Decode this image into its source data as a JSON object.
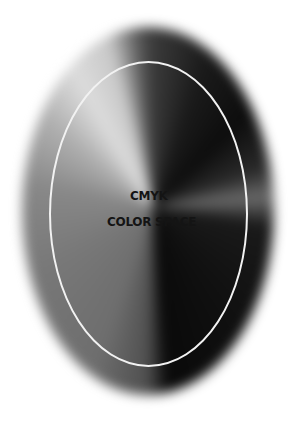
{
  "graphic": {
    "title_line1": "CMYK",
    "title_line2": "COLOR SPACE",
    "ring_color": "#f2f2f2",
    "background": "#ffffff"
  }
}
